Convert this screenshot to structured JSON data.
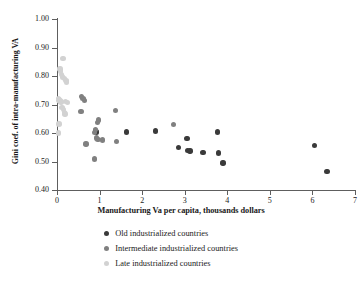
{
  "chart_data": {
    "type": "scatter",
    "title": "",
    "xlabel": "Manufacturing Va per capita, thousands dollars",
    "ylabel": "Gini coef. of intra-manufacturing VA",
    "xlim": [
      0,
      7
    ],
    "ylim": [
      0.4,
      1.0
    ],
    "xticks": [
      "0",
      "1",
      "2",
      "3",
      "4",
      "5",
      "6",
      "7"
    ],
    "xtick_values": [
      0,
      1,
      2,
      3,
      4,
      5,
      6,
      7
    ],
    "yticks": [
      "0.40",
      "0.50",
      "0.60",
      "0.70",
      "0.80",
      "0.90",
      "1.00"
    ],
    "ytick_values": [
      0.4,
      0.5,
      0.6,
      0.7,
      0.8,
      0.9,
      1.0
    ],
    "grid": false,
    "legend_position": "bottom-center",
    "colors": {
      "old": "#3a3a3a",
      "intermediate": "#808080",
      "late": "#d2d2d2",
      "axis": "#5e5e5e",
      "text": "#1a1a1a",
      "background": "#ffffff"
    },
    "series": [
      {
        "name": "Old industrialized countries",
        "color": "#3a3a3a",
        "points": [
          [
            0.9,
            0.608
          ],
          [
            0.93,
            0.604
          ],
          [
            1.63,
            0.604
          ],
          [
            2.32,
            0.607
          ],
          [
            2.85,
            0.549
          ],
          [
            3.05,
            0.581
          ],
          [
            3.07,
            0.538
          ],
          [
            3.12,
            0.537
          ],
          [
            3.43,
            0.531
          ],
          [
            3.77,
            0.604
          ],
          [
            3.79,
            0.53
          ],
          [
            3.9,
            0.495
          ],
          [
            6.05,
            0.556
          ],
          [
            6.34,
            0.464
          ]
        ]
      },
      {
        "name": "Intermediate industrialized countries",
        "color": "#808080",
        "points": [
          [
            0.57,
            0.728
          ],
          [
            0.61,
            0.721
          ],
          [
            0.64,
            0.714
          ],
          [
            0.56,
            0.675
          ],
          [
            0.68,
            0.562
          ],
          [
            0.88,
            0.601
          ],
          [
            0.9,
            0.612
          ],
          [
            0.93,
            0.583
          ],
          [
            0.96,
            0.578
          ],
          [
            0.98,
            0.645
          ],
          [
            0.95,
            0.637
          ],
          [
            0.88,
            0.509
          ],
          [
            1.07,
            0.576
          ],
          [
            1.38,
            0.679
          ],
          [
            1.4,
            0.571
          ],
          [
            2.73,
            0.63
          ]
        ]
      },
      {
        "name": "Late industrialized countries",
        "color": "#d2d2d2",
        "points": [
          [
            0.14,
            0.862
          ],
          [
            0.07,
            0.824
          ],
          [
            0.08,
            0.817
          ],
          [
            0.1,
            0.806
          ],
          [
            0.13,
            0.797
          ],
          [
            0.18,
            0.792
          ],
          [
            0.21,
            0.785
          ],
          [
            0.23,
            0.779
          ],
          [
            0.03,
            0.722
          ],
          [
            0.05,
            0.716
          ],
          [
            0.07,
            0.712
          ],
          [
            0.09,
            0.709
          ],
          [
            0.2,
            0.711
          ],
          [
            0.24,
            0.706
          ],
          [
            0.12,
            0.69
          ],
          [
            0.15,
            0.683
          ],
          [
            0.17,
            0.672
          ],
          [
            0.19,
            0.667
          ],
          [
            0.05,
            0.632
          ],
          [
            0.03,
            0.6
          ]
        ]
      }
    ]
  },
  "legend": {
    "entries": [
      {
        "label": "Old industrialized countries",
        "color": "#3a3a3a"
      },
      {
        "label": "Intermediate industrialized countries",
        "color": "#808080"
      },
      {
        "label": "Late industrialized countries",
        "color": "#d2d2d2"
      }
    ]
  }
}
